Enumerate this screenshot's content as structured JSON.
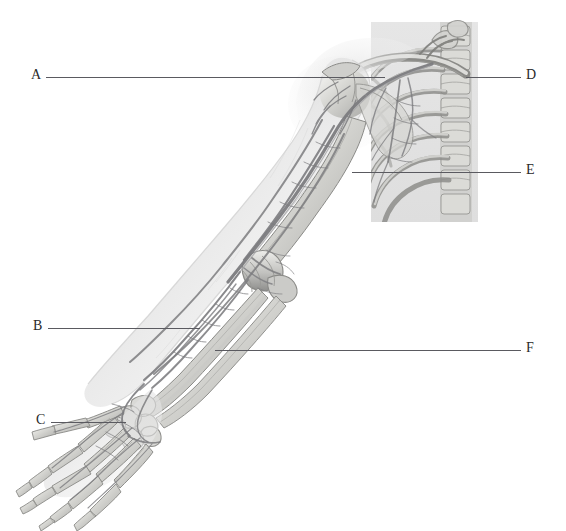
{
  "figure": {
    "background_color": "#ffffff",
    "line_color": "#5a5a60",
    "label_color": "#2a2a2a",
    "panel": {
      "name": "thorax-inset-panel",
      "x": 371,
      "y": 22,
      "width": 107,
      "height": 200,
      "tint": "#e9e9e9"
    }
  },
  "labels": [
    {
      "id": "A",
      "text": "A",
      "label_x": 31,
      "label_y": 68,
      "leader": {
        "x1": 46,
        "y1": 77,
        "x2": 385,
        "y2": 77
      },
      "target": "shoulder-joint-humeral-head"
    },
    {
      "id": "B",
      "text": "B",
      "label_x": 33,
      "label_y": 319,
      "leader": {
        "x1": 48,
        "y1": 328,
        "x2": 200,
        "y2": 328
      },
      "target": "distal-forearm-radius-ulna"
    },
    {
      "id": "C",
      "text": "C",
      "label_x": 36,
      "label_y": 413,
      "leader": {
        "x1": 51,
        "y1": 422,
        "x2": 126,
        "y2": 422
      },
      "target": "metacarpal-bone-of-hand"
    },
    {
      "id": "D",
      "text": "D",
      "label_x": 526,
      "label_y": 68,
      "leader": {
        "x1": 466,
        "y1": 77,
        "x2": 521,
        "y2": 77
      },
      "target": "clavicle"
    },
    {
      "id": "E",
      "text": "E",
      "label_x": 526,
      "label_y": 163,
      "leader": {
        "x1": 352,
        "y1": 172,
        "x2": 521,
        "y2": 172
      },
      "target": "rib"
    },
    {
      "id": "F",
      "text": "F",
      "label_x": 526,
      "label_y": 341,
      "leader": {
        "x1": 215,
        "y1": 350,
        "x2": 521,
        "y2": 350
      },
      "target": "forearm-vein"
    }
  ],
  "anatomy_parts": [
    {
      "name": "clavicle"
    },
    {
      "name": "scapula"
    },
    {
      "name": "humerus"
    },
    {
      "name": "ribcage"
    },
    {
      "name": "thoracic-vertebrae"
    },
    {
      "name": "radius"
    },
    {
      "name": "ulna"
    },
    {
      "name": "carpal-bones"
    },
    {
      "name": "metacarpal-bones"
    },
    {
      "name": "phalanges"
    },
    {
      "name": "brachial-artery"
    },
    {
      "name": "cephalic-vein"
    },
    {
      "name": "basilic-vein"
    }
  ]
}
